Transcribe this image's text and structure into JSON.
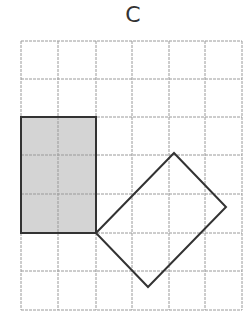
{
  "figure": {
    "label": "C",
    "grid": {
      "columns": 6,
      "rows": 7,
      "x_lines": [
        21,
        58,
        96,
        132,
        169,
        205,
        242
      ],
      "y_lines": [
        41,
        79,
        117,
        155,
        194,
        233,
        271,
        310
      ],
      "line_color": "#9a9a9a"
    },
    "shaded_rectangle": {
      "grid_cols": 2,
      "grid_rows": 3,
      "x": 21,
      "y": 117,
      "width": 75,
      "height": 116,
      "fill": "#d4d4d4",
      "stroke": "#333333"
    },
    "rotated_rectangle": {
      "points": [
        [
          96,
          233
        ],
        [
          174,
          153
        ],
        [
          226,
          207
        ],
        [
          148,
          287
        ]
      ],
      "fill": "none",
      "stroke": "#333333"
    }
  }
}
